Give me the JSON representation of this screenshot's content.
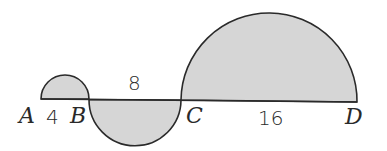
{
  "diagram": {
    "type": "geometry-semicircles",
    "points": [
      {
        "label": "A",
        "x": 41
      },
      {
        "label": "B",
        "x": 89
      },
      {
        "label": "C",
        "x": 181
      },
      {
        "label": "D",
        "x": 357
      }
    ],
    "segments": [
      {
        "from": "A",
        "to": "B",
        "length_label": "4",
        "semicircle_side": "above"
      },
      {
        "from": "B",
        "to": "C",
        "length_label": "8",
        "semicircle_side": "below"
      },
      {
        "from": "C",
        "to": "D",
        "length_label": "16",
        "semicircle_side": "above"
      }
    ],
    "colors": {
      "fill": "#d6d6d6",
      "stroke": "#2a2a2a"
    }
  }
}
